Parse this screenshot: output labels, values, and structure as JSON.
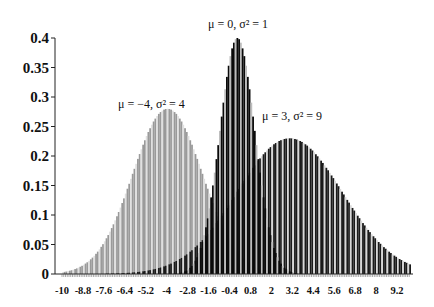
{
  "chart_data": {
    "type": "bar",
    "title": "",
    "xlabel": "",
    "ylabel": "",
    "xlim": [
      -10,
      10
    ],
    "ylim": [
      0,
      0.4
    ],
    "grid": false,
    "legend": "none",
    "x_step": 0.1,
    "y_ticks": [
      "0",
      "0.05",
      "0.1",
      "0.15",
      "0.2",
      "0.25",
      "0.3",
      "0.35",
      "0.4"
    ],
    "y_tick_values": [
      0,
      0.05,
      0.1,
      0.15,
      0.2,
      0.25,
      0.3,
      0.35,
      0.4
    ],
    "x_ticks": [
      "-10",
      "-8.8",
      "-7.6",
      "-6.4",
      "-5.2",
      "-4",
      "-2.8",
      "-1.6",
      "-0.4",
      "0.8",
      "2",
      "3.2",
      "4.4",
      "5.6",
      "6.8",
      "8",
      "9.2"
    ],
    "x_tick_values": [
      -10,
      -8.8,
      -7.6,
      -6.4,
      -5.2,
      -4,
      -2.8,
      -1.6,
      -0.4,
      0.8,
      2,
      3.2,
      4.4,
      5.6,
      6.8,
      8,
      9.2
    ],
    "series": [
      {
        "name": "μ = -4, σ² = 4",
        "mu": -4,
        "variance": 4,
        "peak": 0.1995,
        "color": "#9a9a9a",
        "stripe": "#e0e0e0"
      },
      {
        "name": "μ = 3, σ² = 9",
        "mu": 3,
        "variance": 9,
        "peak": 0.133,
        "color": "#1a1a1a",
        "stripe": "#d8d8d8"
      },
      {
        "name": "μ = 0, σ² = 1",
        "mu": 0,
        "variance": 1,
        "peak": 0.3989,
        "color": "#0a0a0a",
        "stripe": "#bdbdbd"
      }
    ],
    "visual_peaks": {
      "mu_-4": 0.28,
      "mu_0": 0.4,
      "mu_3": 0.23
    },
    "annotations": [
      {
        "text": "μ = -4, σ² = 4",
        "x": -4,
        "y": 0.31
      },
      {
        "text": "μ = 0, σ² = 1",
        "x": 0,
        "y": 0.42
      },
      {
        "text": "μ = 3, σ² = 9",
        "x": 3,
        "y": 0.26
      }
    ]
  },
  "labels": {
    "ann1": "μ = −4, σ² = 4",
    "ann2": "μ = 0, σ² = 1",
    "ann3": "μ = 3, σ² = 9"
  }
}
